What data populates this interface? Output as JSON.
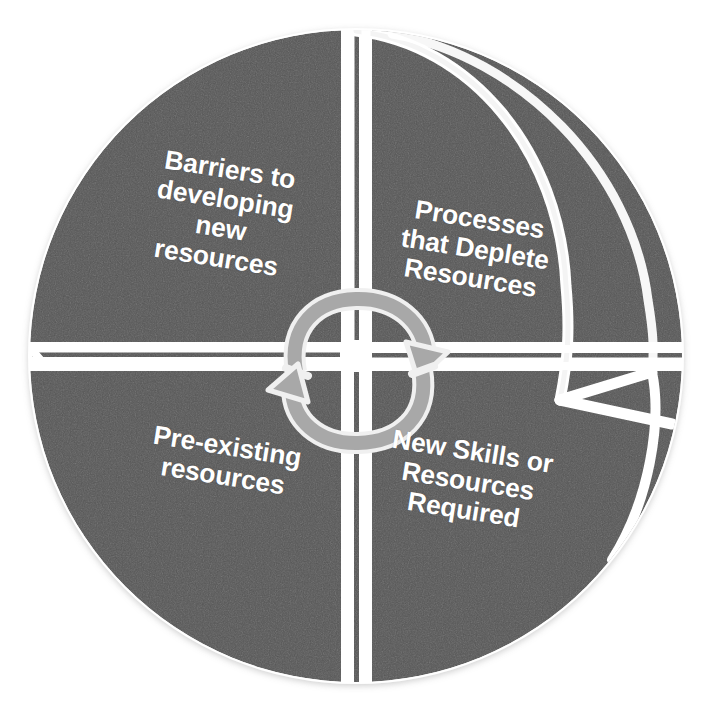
{
  "diagram": {
    "type": "four-quadrant-cycle-wheel",
    "shape": "circle-with-3d-rim",
    "colors": {
      "quadrant_fill": "#565656",
      "divider": "#ffffff",
      "label_text": "#ffffff",
      "background": "#ffffff",
      "arrow_fill": "#a6a6a6",
      "arrow_stroke": "#f2f2f2",
      "rim_shadow": "#4a4a4a"
    },
    "center_graphic": {
      "name": "circular-cycle-arrows",
      "arrow_count": 2,
      "top_arrow_direction": "clockwise",
      "bottom_arrow_direction": "clockwise"
    },
    "quadrants": [
      {
        "position": "top-left",
        "id": "barriers-to-developing-new-resources",
        "label": "Barriers to\ndeveloping\nnew\nresources",
        "lines": [
          "Barriers to",
          "developing",
          "new",
          "resources"
        ]
      },
      {
        "position": "top-right",
        "id": "processes-that-deplete-resources",
        "label": "Processes\nthat Deplete\nResources",
        "lines": [
          "Processes",
          "that Deplete",
          "Resources"
        ]
      },
      {
        "position": "bottom-left",
        "id": "pre-existing-resources",
        "label": "Pre-existing\nresources",
        "lines": [
          "Pre-existing",
          "resources"
        ]
      },
      {
        "position": "bottom-right",
        "id": "new-skills-or-resources-required",
        "label": "New Skills or\nResources\nRequired",
        "lines": [
          "New Skills or",
          "Resources",
          "Required"
        ]
      }
    ]
  }
}
